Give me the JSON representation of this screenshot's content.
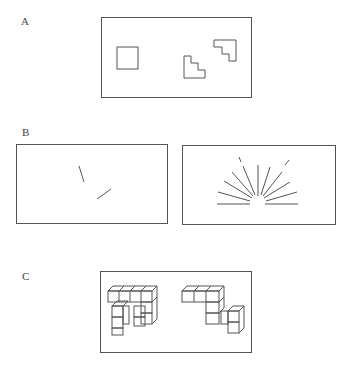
{
  "panels": {
    "a": {
      "label": "A",
      "description": "Square and two staircase outlines in a frame"
    },
    "b": {
      "label": "B",
      "description": "Two frames: two oblique line segments; radiating sunburst of lines"
    },
    "c": {
      "label": "C",
      "description": "Two 3D cube-assembly figures in a frame"
    }
  },
  "caption": "",
  "colors": {
    "stroke": "#555555",
    "background": "#ffffff"
  }
}
